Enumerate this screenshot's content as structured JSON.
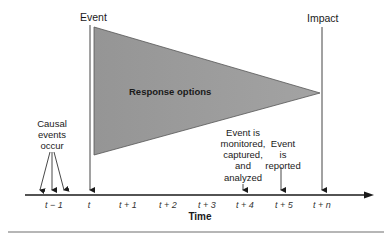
{
  "diagram": {
    "labels": {
      "event": "Event",
      "impact": "Impact",
      "response_options": "Response options",
      "causal": [
        "Causal",
        "events",
        "occur"
      ],
      "monitored": [
        "Event is",
        "monitored,",
        "captured,",
        "and",
        "analyzed"
      ],
      "reported": [
        "Event",
        "is",
        "reported"
      ],
      "axis": "Time"
    },
    "ticks": [
      "t − 1",
      "t",
      "t + 1",
      "t + 2",
      "t + 3",
      "t + 4",
      "t + 5",
      "t + n"
    ],
    "colors": {
      "triangle_fill": "#9a9a9a",
      "line": "#1a1a1a",
      "rule": "#9e9e9e"
    }
  }
}
